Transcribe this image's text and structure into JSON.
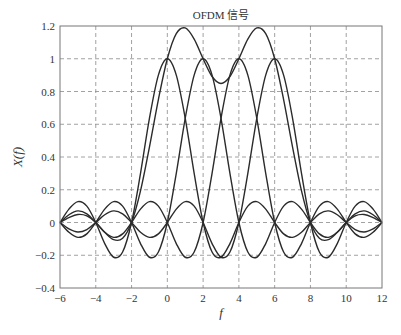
{
  "chart_data": {
    "type": "line",
    "title": "OFDM 信号",
    "xlabel": "f",
    "ylabel": "X(f)",
    "xlim": [
      -6,
      12
    ],
    "ylim": [
      -0.4,
      1.2
    ],
    "xticks": [
      -6,
      -4,
      -2,
      0,
      2,
      4,
      6,
      8,
      10,
      12
    ],
    "xtick_labels": [
      "−6",
      "−4",
      "−2",
      "0",
      "2",
      "4",
      "6",
      "8",
      "10",
      "12"
    ],
    "yticks": [
      -0.4,
      -0.2,
      0,
      0.2,
      0.4,
      0.6,
      0.8,
      1,
      1.2
    ],
    "ytick_labels": [
      "−0.4",
      "−0.2",
      "0",
      "0.2",
      "0.4",
      "0.6",
      "0.8",
      "1",
      "1.2"
    ],
    "grid": true,
    "grid_style": "dashed",
    "legend": null,
    "line_color": "#2b2b2b",
    "x": [
      -6,
      -5.5,
      -5,
      -4.5,
      -4,
      -3.5,
      -3,
      -2.5,
      -2,
      -1.5,
      -1,
      -0.5,
      0,
      0.5,
      1,
      1.5,
      2,
      2.5,
      3,
      3.5,
      4,
      4.5,
      5,
      5.5,
      6,
      6.5,
      7,
      7.5,
      8,
      8.5,
      9,
      9.5,
      10,
      10.5,
      11,
      11.5,
      12
    ],
    "series": [
      {
        "name": "subcarrier f0=0",
        "values": [
          0,
          0.0818,
          0.1273,
          0.1,
          0,
          -0.1286,
          -0.2122,
          -0.1801,
          0,
          0.3001,
          0.6366,
          0.9003,
          1,
          0.9003,
          0.6366,
          0.3001,
          0,
          -0.1801,
          -0.2122,
          -0.1286,
          0,
          0.1,
          0.1273,
          0.0818,
          0,
          -0.0693,
          -0.0909,
          -0.06,
          0,
          0.053,
          0.0707,
          0.0474,
          0,
          -0.0429,
          -0.0579,
          -0.0391,
          0
        ]
      },
      {
        "name": "subcarrier f0=2",
        "values": [
          0,
          -0.06,
          -0.0909,
          -0.0693,
          0,
          0.0818,
          0.1273,
          0.1,
          0,
          -0.1286,
          -0.2122,
          -0.1801,
          0,
          0.3001,
          0.6366,
          0.9003,
          1,
          0.9003,
          0.6366,
          0.3001,
          0,
          -0.1801,
          -0.2122,
          -0.1286,
          0,
          0.1,
          0.1273,
          0.0818,
          0,
          -0.0693,
          -0.0909,
          -0.06,
          0,
          0.053,
          0.0707,
          0.0474,
          0
        ]
      },
      {
        "name": "subcarrier f0=4",
        "values": [
          0,
          0.0474,
          0.0707,
          0.053,
          0,
          -0.06,
          -0.0909,
          -0.0693,
          0,
          0.0818,
          0.1273,
          0.1,
          0,
          -0.1286,
          -0.2122,
          -0.1801,
          0,
          0.3001,
          0.6366,
          0.9003,
          1,
          0.9003,
          0.6366,
          0.3001,
          0,
          -0.1801,
          -0.2122,
          -0.1286,
          0,
          0.1,
          0.1273,
          0.0818,
          0,
          -0.0693,
          -0.0909,
          -0.06,
          0
        ]
      },
      {
        "name": "subcarrier f0=6",
        "values": [
          0,
          -0.0391,
          -0.0579,
          -0.0429,
          0,
          0.0474,
          0.0707,
          0.053,
          0,
          -0.06,
          -0.0909,
          -0.0693,
          0,
          0.0818,
          0.1273,
          0.1,
          0,
          -0.1286,
          -0.2122,
          -0.1801,
          0,
          0.3001,
          0.6366,
          0.9003,
          1,
          0.9003,
          0.6366,
          0.3001,
          0,
          -0.1801,
          -0.2122,
          -0.1286,
          0,
          0.1,
          0.1273,
          0.0818,
          0
        ]
      },
      {
        "name": "OFDM sum",
        "values": [
          0,
          0.0301,
          0.0492,
          0.0408,
          0,
          -0.0594,
          -0.1051,
          -0.0964,
          0,
          0.1933,
          0.4608,
          0.7509,
          1,
          1.1536,
          1.1883,
          1.1203,
          1,
          0.8917,
          0.8488,
          0.8917,
          1,
          1.1203,
          1.1883,
          1.1536,
          1,
          0.7509,
          0.4608,
          0.1933,
          0,
          -0.0964,
          -0.1051,
          -0.0594,
          0,
          0.0408,
          0.0492,
          0.0301,
          0
        ]
      }
    ]
  }
}
